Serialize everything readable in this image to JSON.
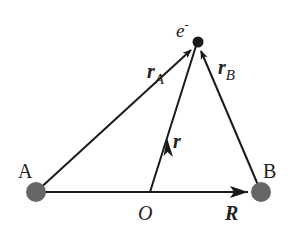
{
  "diagram": {
    "points": {
      "A": {
        "label": "A",
        "x": 36,
        "y": 192
      },
      "B": {
        "label": "B",
        "x": 261,
        "y": 192
      },
      "O": {
        "label": "O",
        "x": 150,
        "y": 192
      },
      "e": {
        "label": "e",
        "sup": "-",
        "x": 198,
        "y": 42
      }
    },
    "vectors": {
      "rA": {
        "main": "r",
        "sub": "A"
      },
      "rB": {
        "main": "r",
        "sub": "B"
      },
      "r": {
        "main": "r"
      },
      "R": {
        "main": "R"
      }
    },
    "colors": {
      "line": "#1a1a1a",
      "charge": "#666666",
      "electron": "#1a1a1a"
    }
  }
}
